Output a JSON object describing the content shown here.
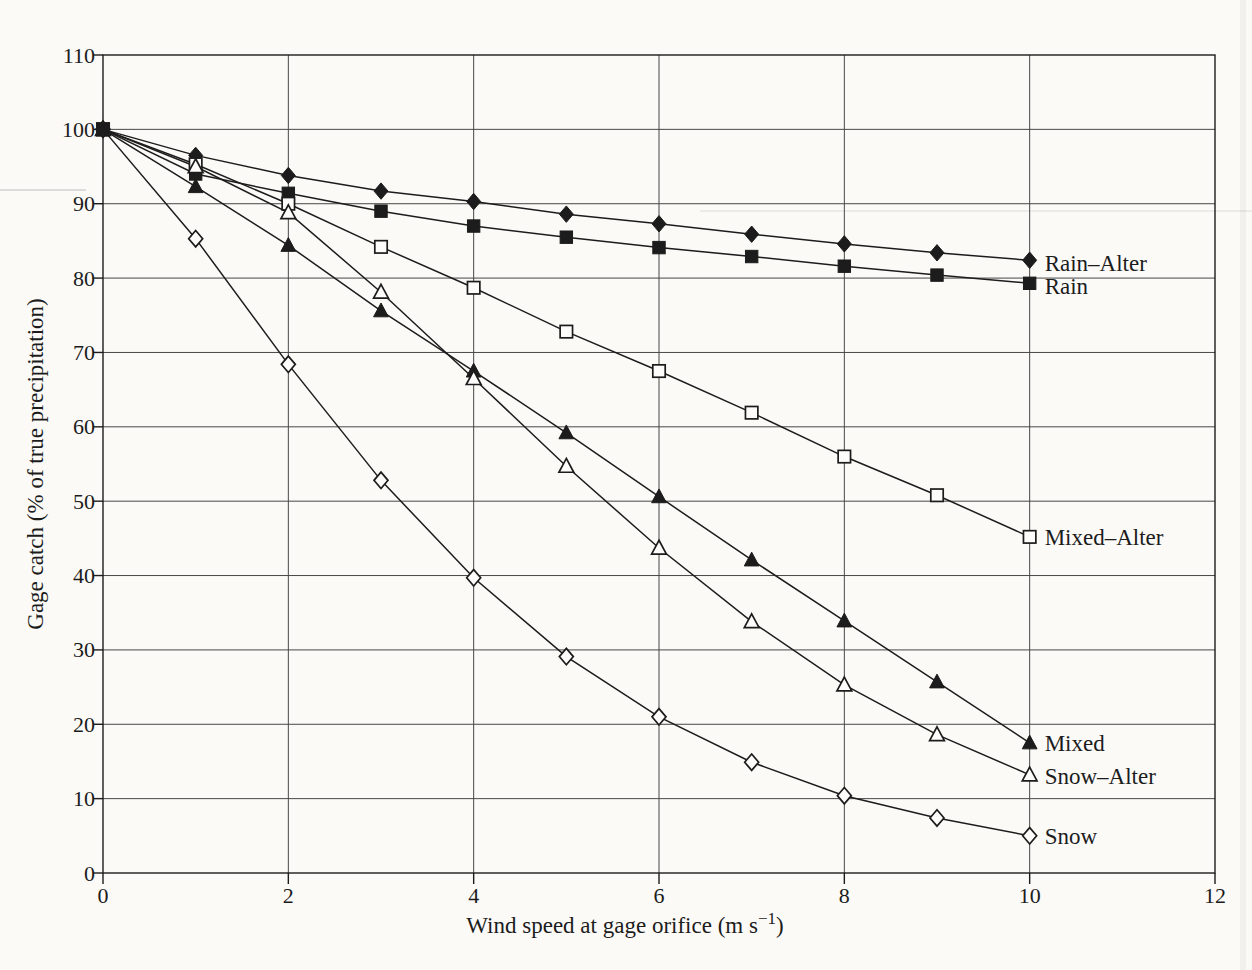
{
  "style": {
    "paper_color": "#fbfaf7",
    "marker_face_color": "#fdfcfa",
    "ink_color": "#1c1c1c",
    "grid_color": "#474747"
  },
  "chart_data": {
    "type": "line",
    "title": "",
    "xlabel": "Wind speed at gage orifice (m s⁻¹)",
    "xlabel_parts": [
      "Wind speed at gage orifice (m s",
      "−1",
      ")"
    ],
    "ylabel": "Gage catch (% of true precipitation)",
    "xlim": [
      0,
      12
    ],
    "ylim": [
      0,
      110
    ],
    "x_ticks": [
      0,
      2,
      4,
      6,
      8,
      10,
      12
    ],
    "y_ticks": [
      0,
      10,
      20,
      30,
      40,
      50,
      60,
      70,
      80,
      90,
      100,
      110
    ],
    "grid": true,
    "legend_position": "inline-right-labels",
    "x": [
      0,
      1,
      2,
      3,
      4,
      5,
      6,
      7,
      8,
      9,
      10
    ],
    "series": [
      {
        "name": "Rain–Alter",
        "marker": "filled-diamond",
        "label_y": 82.0,
        "values": [
          100,
          96.5,
          93.8,
          91.7,
          90.3,
          88.6,
          87.3,
          85.9,
          84.6,
          83.4,
          82.4
        ]
      },
      {
        "name": "Rain",
        "marker": "filled-square",
        "label_y": 79.0,
        "values": [
          100,
          94.0,
          91.4,
          89.0,
          87.0,
          85.5,
          84.1,
          82.9,
          81.6,
          80.4,
          79.3
        ]
      },
      {
        "name": "Mixed–Alter",
        "marker": "open-square",
        "label_y": 45.2,
        "values": [
          100,
          95.3,
          90.0,
          84.2,
          78.7,
          72.8,
          67.5,
          61.9,
          56.0,
          50.8,
          45.2
        ]
      },
      {
        "name": "Mixed",
        "marker": "filled-triangle",
        "label_y": 17.5,
        "values": [
          100,
          92.3,
          84.4,
          75.6,
          67.5,
          59.2,
          50.6,
          42.1,
          33.9,
          25.7,
          17.5
        ]
      },
      {
        "name": "Snow–Alter",
        "marker": "open-triangle",
        "label_y": 13.0,
        "values": [
          100,
          95.0,
          88.8,
          78.1,
          66.5,
          54.7,
          43.7,
          33.8,
          25.3,
          18.6,
          13.2
        ]
      },
      {
        "name": "Snow",
        "marker": "open-diamond",
        "label_y": 5.0,
        "values": [
          100,
          85.3,
          68.4,
          52.8,
          39.7,
          29.1,
          21.0,
          14.9,
          10.4,
          7.4,
          5.0
        ]
      }
    ]
  }
}
